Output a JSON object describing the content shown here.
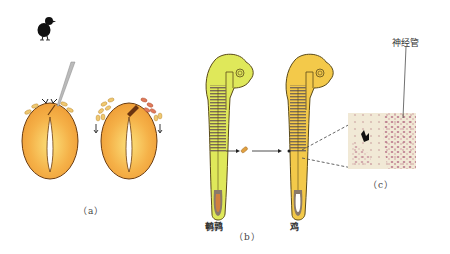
{
  "figure": {
    "panels": [
      {
        "id": "a",
        "caption": "（a）",
        "description": "Two eggs with embryos; a needle removes tissue from the first, second shows grafted tissue"
      },
      {
        "id": "b",
        "caption": "（b）",
        "description": "Quail embryo tissue transplanted into chick embryo",
        "embryos": [
          {
            "label": "鹌鹑",
            "color": "#dfe85a"
          },
          {
            "label": "鸡",
            "color": "#f3c94a"
          }
        ]
      },
      {
        "id": "c",
        "caption": "（c）",
        "description": "Micrograph of tissue section",
        "annotation": "神经管"
      }
    ],
    "colors": {
      "egg_fill": "#f3a43a",
      "egg_center": "#f9d36a",
      "egg_outline": "#6b3c10",
      "quail_embryo": "#dfe85a",
      "chick_embryo": "#f3c94a",
      "outline": "#5a4a1a",
      "cells_yellow": "#ecc266",
      "cells_red": "#e07a5a"
    },
    "icons": [
      "chick-silhouette-icon",
      "needle-icon",
      "arrow-icon"
    ]
  }
}
